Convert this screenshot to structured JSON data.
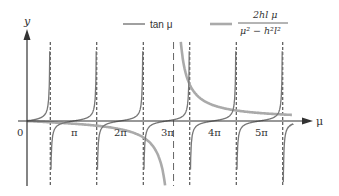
{
  "chart_data": {
    "type": "line",
    "title": "",
    "xlabel": "μ",
    "ylabel": "y",
    "origin_label": "0",
    "tick_labels": [
      "π",
      "2π",
      "3π",
      "4π",
      "5π"
    ],
    "tick_values": [
      3.1416,
      6.2832,
      9.4248,
      12.5664,
      15.708
    ],
    "xlim": [
      0,
      18.0
    ],
    "ylim": [
      -5,
      5
    ],
    "grid": false,
    "legend_position": "top-right",
    "series": [
      {
        "name": "tan μ",
        "color": "#777777",
        "style": "solid-thin",
        "asymptotes": [
          1.5708,
          4.7124,
          7.854,
          10.9956,
          14.1372,
          17.2788
        ]
      },
      {
        "name": "2hl μ / (μ² − h²l²)",
        "color": "#aaaaaa",
        "style": "solid-thick",
        "hl": 9.9,
        "asymptotes": [
          9.9
        ]
      }
    ],
    "annotations": [
      "dashed vertical asymptotes at odd multiples of π/2",
      "long-dashed asymptote at μ = hl"
    ]
  },
  "legend": {
    "tan_label": "tan μ",
    "frac_numerator": "2hl μ",
    "frac_denominator": "μ² − h²l²"
  },
  "axes": {
    "y_label": "y",
    "x_label": "μ",
    "origin": "0",
    "ticks": [
      "π",
      "2π",
      "3π",
      "4π",
      "5π"
    ]
  }
}
